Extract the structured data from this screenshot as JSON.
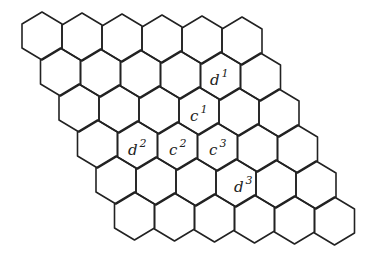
{
  "diagram": {
    "type": "hexagonal-grid",
    "rows": 6,
    "cols": 6,
    "hex_width": 40,
    "hex_side": 24,
    "row_offset_x": 18.5,
    "row_offset_y": 36,
    "origin": {
      "cx": 42,
      "cy": 36
    },
    "stroke_color": "#222222",
    "labels": [
      {
        "id": "d1",
        "base": "d",
        "sup": "1",
        "x": 210,
        "y": 70
      },
      {
        "id": "c1",
        "base": "c",
        "sup": "1",
        "x": 190,
        "y": 106
      },
      {
        "id": "d2",
        "base": "d",
        "sup": "2",
        "x": 128,
        "y": 140
      },
      {
        "id": "c2",
        "base": "c",
        "sup": "2",
        "x": 169,
        "y": 140
      },
      {
        "id": "c3",
        "base": "c",
        "sup": "3",
        "x": 209,
        "y": 140
      },
      {
        "id": "d3",
        "base": "d",
        "sup": "3",
        "x": 234,
        "y": 177
      }
    ]
  }
}
